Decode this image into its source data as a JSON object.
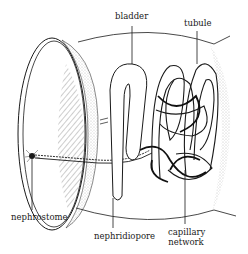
{
  "diagram": {
    "labels": {
      "bladder": "bladder",
      "tubule": "tubule",
      "nephrostome": "nephrostome",
      "nephridiopore": "nephridiopore",
      "capillary_line1": "capillary",
      "capillary_line2": "network"
    },
    "colors": {
      "ink": "#1a1a1a",
      "background": "#ffffff",
      "stipple": "#8a8a8a"
    }
  }
}
